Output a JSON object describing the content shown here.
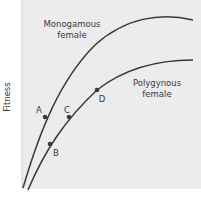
{
  "diagram": {
    "ylabel": "Fitness",
    "background_color": "#ececec",
    "curve_color": "#3a3a3a",
    "curves": [
      {
        "name": "monogamous",
        "label_line1": "Monogamous",
        "label_line2": "female"
      },
      {
        "name": "polygynous",
        "label_line1": "Polygynous",
        "label_line2": "female"
      }
    ],
    "points": [
      {
        "label": "A",
        "curve": "monogamous"
      },
      {
        "label": "B",
        "curve": "polygynous"
      },
      {
        "label": "C",
        "curve": "polygynous"
      },
      {
        "label": "D",
        "curve": "polygynous"
      }
    ]
  }
}
